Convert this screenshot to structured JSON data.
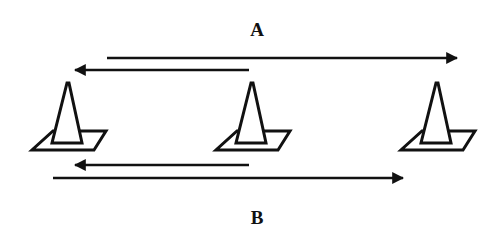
{
  "diagram": {
    "type": "drill-layout",
    "stroke_color": "#111111",
    "background": "#ffffff",
    "labels": [
      {
        "id": "A",
        "text": "A",
        "x": 257,
        "y": 20
      },
      {
        "id": "B",
        "text": "B",
        "x": 257,
        "y": 208
      }
    ],
    "cones": [
      {
        "id": "cone-1",
        "cx": 68
      },
      {
        "id": "cone-2",
        "cx": 252
      },
      {
        "id": "cone-3",
        "cx": 437
      }
    ],
    "arrows": [
      {
        "id": "arrow-a-forward",
        "group": "A",
        "direction": "right",
        "x1": 107,
        "x2": 457,
        "y": 58
      },
      {
        "id": "arrow-a-back",
        "group": "A",
        "direction": "left",
        "x1": 249,
        "x2": 75,
        "y": 70
      },
      {
        "id": "arrow-b-back",
        "group": "B",
        "direction": "left",
        "x1": 249,
        "x2": 75,
        "y": 165
      },
      {
        "id": "arrow-b-forward",
        "group": "B",
        "direction": "right",
        "x1": 53,
        "x2": 403,
        "y": 178
      }
    ]
  }
}
